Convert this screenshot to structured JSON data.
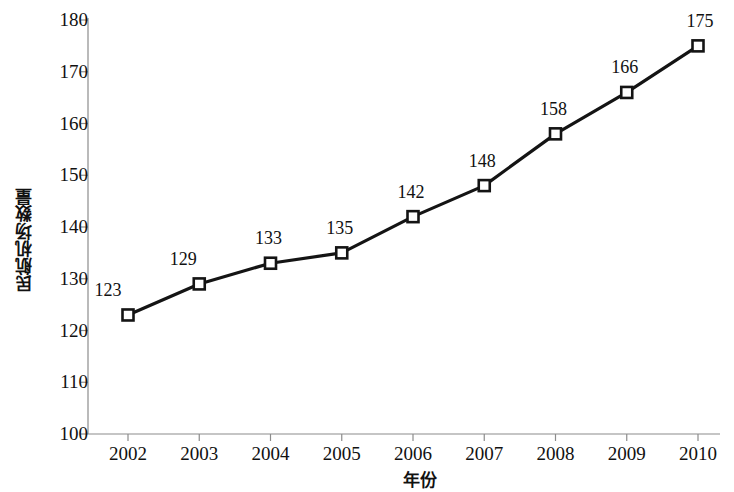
{
  "chart_data": {
    "type": "line",
    "title": "",
    "subtitle": "",
    "xlabel": "年份",
    "ylabel": "民航机场数量",
    "categories": [
      "2002",
      "2003",
      "2004",
      "2005",
      "2006",
      "2007",
      "2008",
      "2009",
      "2010"
    ],
    "values": [
      123,
      129,
      133,
      135,
      142,
      148,
      158,
      166,
      175
    ],
    "point_labels": [
      "123",
      "129",
      "133",
      "135",
      "142",
      "148",
      "158",
      "166",
      "175"
    ],
    "ylim": [
      100,
      180
    ],
    "yticks": [
      100,
      110,
      120,
      130,
      140,
      150,
      160,
      170,
      180
    ],
    "ytick_labels": [
      "100",
      "110",
      "120",
      "130",
      "140",
      "150",
      "160",
      "170",
      "180"
    ],
    "grid": false,
    "legend": false,
    "legend_position": "none",
    "series": [
      {
        "name": "民航机场数量",
        "values": [
          123,
          129,
          133,
          135,
          142,
          148,
          158,
          166,
          175
        ],
        "line_color": "#141414",
        "marker": "square-open",
        "marker_face_color": "#ffffff",
        "marker_edge_color": "#141414"
      }
    ],
    "colors": {
      "line": "#141414",
      "marker_fill": "#ffffff",
      "marker_edge": "#141414",
      "axis": "#8c8c8c",
      "text": "#111111",
      "background": "#ffffff"
    }
  }
}
